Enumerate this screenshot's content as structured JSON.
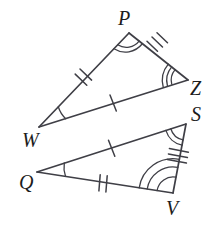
{
  "figure": {
    "kind": "geometry-diagram",
    "stroke_color": "#3f3f46",
    "label_color": "#1c1c1c",
    "background_color": "#ffffff",
    "stroke_width": 1.6,
    "triangles": [
      {
        "name": "triangle-pwz",
        "vertices": [
          "P",
          "W",
          "Z"
        ]
      },
      {
        "name": "triangle-sqv",
        "vertices": [
          "S",
          "Q",
          "V"
        ]
      }
    ],
    "labels": [
      {
        "name": "vertex-label-p",
        "text": "P",
        "x": 118,
        "y": 8
      },
      {
        "name": "vertex-label-z",
        "text": "Z",
        "x": 190,
        "y": 78
      },
      {
        "name": "vertex-label-w",
        "text": "W",
        "x": 22,
        "y": 130
      },
      {
        "name": "vertex-label-s",
        "text": "S",
        "x": 191,
        "y": 104
      },
      {
        "name": "vertex-label-q",
        "text": "Q",
        "x": 19,
        "y": 172
      },
      {
        "name": "vertex-label-v",
        "text": "V",
        "x": 166,
        "y": 198
      }
    ],
    "points": {
      "P": {
        "x": 129,
        "y": 33
      },
      "Z": {
        "x": 188,
        "y": 80
      },
      "W": {
        "x": 39,
        "y": 127
      },
      "S": {
        "x": 186,
        "y": 124
      },
      "Q": {
        "x": 37,
        "y": 172
      },
      "V": {
        "x": 173,
        "y": 193
      }
    },
    "side_marks": [
      {
        "name": "tick-mark-wp",
        "side": "W-P",
        "count": 2
      },
      {
        "name": "tick-mark-wz",
        "side": "W-Z",
        "count": 1
      },
      {
        "name": "tick-mark-pz",
        "side": "P-Z",
        "count": 3
      },
      {
        "name": "tick-mark-qs",
        "side": "Q-S",
        "count": 1
      },
      {
        "name": "tick-mark-qv",
        "side": "Q-V",
        "count": 2
      },
      {
        "name": "tick-mark-sv",
        "side": "S-V",
        "count": 3
      }
    ],
    "angle_marks": [
      {
        "name": "angle-arc-p",
        "vertex": "P",
        "count": 2
      },
      {
        "name": "angle-arc-z",
        "vertex": "Z",
        "count": 3
      },
      {
        "name": "angle-arc-w",
        "vertex": "W",
        "count": 1
      },
      {
        "name": "angle-arc-s",
        "vertex": "S",
        "count": 2
      },
      {
        "name": "angle-arc-v",
        "vertex": "V",
        "count": 3
      },
      {
        "name": "angle-arc-q",
        "vertex": "Q",
        "count": 1
      }
    ]
  }
}
